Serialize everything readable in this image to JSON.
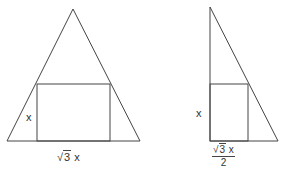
{
  "figures": [
    {
      "name": "isosceles-triangle-with-inscribed-rectangle",
      "labels": {
        "height": "x",
        "base_radical": "3",
        "base_var": "x"
      }
    },
    {
      "name": "right-triangle-with-inscribed-rectangle",
      "labels": {
        "height": "x",
        "num_radical": "3",
        "num_var": "x",
        "denominator": "2"
      }
    }
  ],
  "colors": {
    "stroke": "#444444",
    "text": "#333333",
    "background": "#ffffff"
  }
}
